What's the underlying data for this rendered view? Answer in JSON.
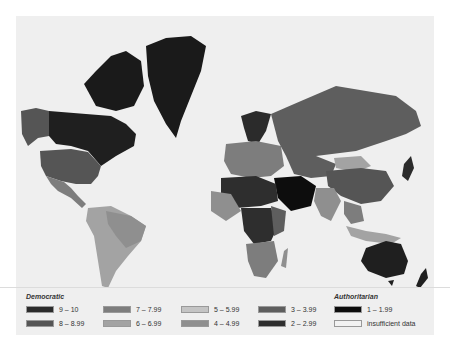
{
  "map": {
    "title": "Democracy Index world map",
    "background_color": "#efefef",
    "ocean_color": "#efefef"
  },
  "legend": {
    "democratic_title": "Democratic",
    "authoritarian_title": "Authoritarian",
    "items": [
      {
        "label": "9 – 10",
        "color": "#2b2b2b"
      },
      {
        "label": "8 – 8.99",
        "color": "#555555"
      },
      {
        "label": "7 – 7.99",
        "color": "#7d7d7d"
      },
      {
        "label": "6 – 6.99",
        "color": "#a3a3a3"
      },
      {
        "label": "5 – 5.99",
        "color": "#c4c4c4"
      },
      {
        "label": "4 – 4.99",
        "color": "#8f8f8f"
      },
      {
        "label": "3 – 3.99",
        "color": "#5e5e5e"
      },
      {
        "label": "2 – 2.99",
        "color": "#2e2e2e"
      },
      {
        "label": "1 – 1.99",
        "color": "#0d0d0d"
      },
      {
        "label": "insufficient data",
        "color": "#f2f2f2"
      }
    ]
  },
  "caption": {
    "text": "Democracy Index world map"
  }
}
